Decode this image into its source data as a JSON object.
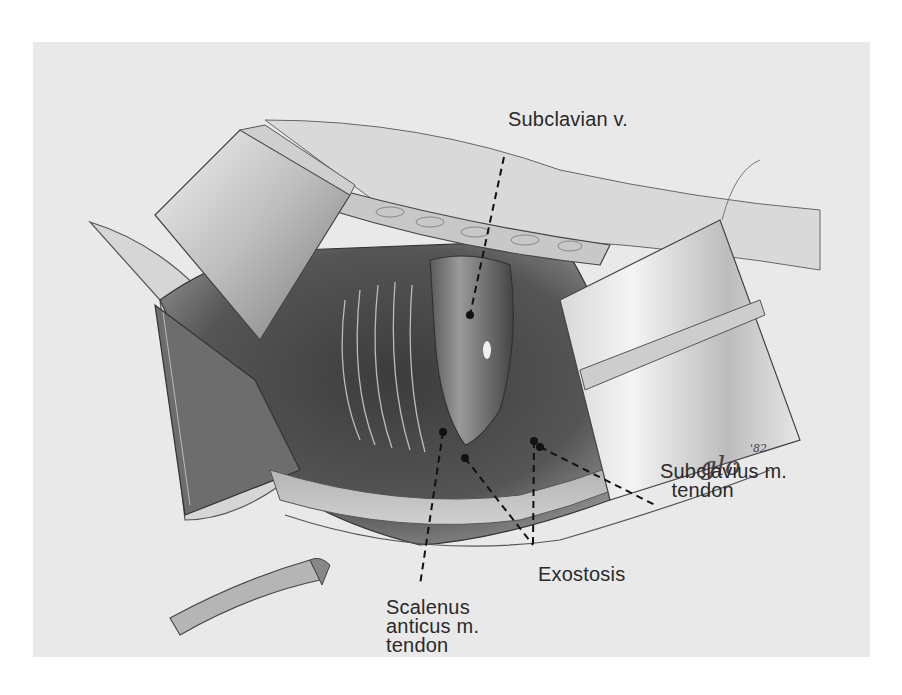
{
  "figure": {
    "type": "surgical illustration",
    "background_color": "#ffffff",
    "panel_color": "#e9e9e9",
    "signature": "glo '82"
  },
  "labels": [
    {
      "id": "subclavian-v",
      "text": "Subclavian v."
    },
    {
      "id": "subclavius-tendon",
      "text": "Subclavius m.\n  tendon"
    },
    {
      "id": "exostosis",
      "text": "Exostosis"
    },
    {
      "id": "scalenus-anticus-tendon",
      "text": "Scalenus\nanticus m.\ntendon"
    }
  ]
}
